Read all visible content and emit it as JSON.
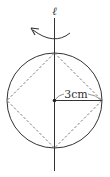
{
  "diagram": {
    "axis_label": "ℓ",
    "radius_label": "3cm",
    "colors": {
      "stroke": "#333333",
      "dashed": "#666666",
      "background": "#ffffff"
    },
    "elements": {
      "axis": "vertical rotation axis",
      "circle": "circle of radius 3cm",
      "inscribed_square": "dashed square inscribed in circle (rotated 45°)",
      "radius": "segment from center to right edge",
      "rotation_arrow": "curved arrow around axis"
    }
  }
}
